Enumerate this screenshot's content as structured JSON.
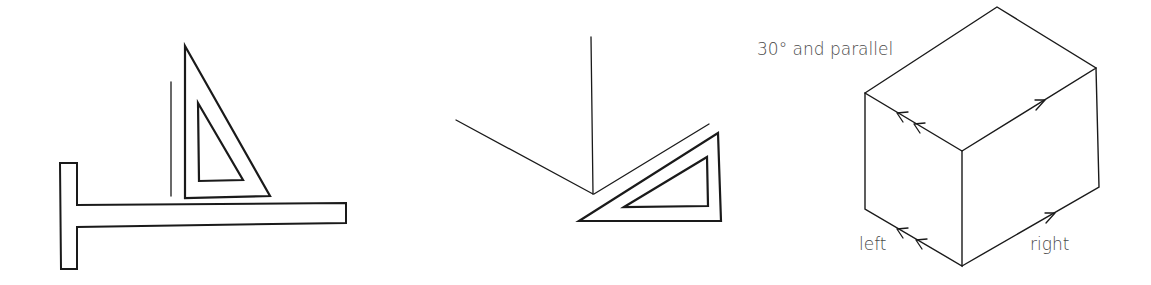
{
  "figures": [
    {
      "id": "t-square-setsquare",
      "description": "T-square with set square resting on blade and vertical line drawn"
    },
    {
      "id": "setsquare-30deg",
      "description": "Set square drawing 30 degree line from vertical"
    },
    {
      "id": "isometric-box",
      "description": "Isometric box showing 30 degree parallel edges"
    }
  ],
  "labels": {
    "angle": "30° and parallel",
    "left": "left",
    "right": "right"
  },
  "colors": {
    "stroke": "#1a1a1a",
    "text": "#4a4a4a",
    "background": "#ffffff"
  }
}
